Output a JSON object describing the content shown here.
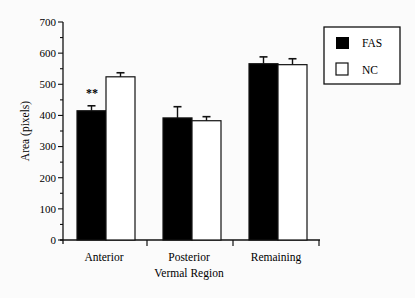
{
  "chart_data": {
    "type": "bar",
    "title": "",
    "xlabel": "Vermal Region",
    "ylabel": "Area (pixels)",
    "ylim": [
      0,
      700
    ],
    "yticks": [
      0,
      100,
      200,
      300,
      400,
      500,
      600,
      700
    ],
    "grid": false,
    "legend_position": "top-right",
    "categories": [
      "Anterior",
      "Posterior",
      "Remaining"
    ],
    "series": [
      {
        "name": "FAS",
        "color": "#000000",
        "values": [
          415,
          392,
          566
        ],
        "error": [
          16,
          36,
          22
        ]
      },
      {
        "name": "NC",
        "color": "#ffffff",
        "values": [
          524,
          383,
          563
        ],
        "error": [
          13,
          13,
          19
        ]
      }
    ],
    "annotations": [
      {
        "category": "Anterior",
        "series": "FAS",
        "text": "**"
      }
    ]
  },
  "labels": {
    "xlabel": "Vermal Region",
    "ylabel": "Area (pixels)",
    "cat0": "Anterior",
    "cat1": "Posterior",
    "cat2": "Remaining",
    "legend0": "FAS",
    "legend1": "NC",
    "sig": "**",
    "y0": "0",
    "y1": "100",
    "y2": "200",
    "y3": "300",
    "y4": "400",
    "y5": "500",
    "y6": "600",
    "y7": "700"
  }
}
